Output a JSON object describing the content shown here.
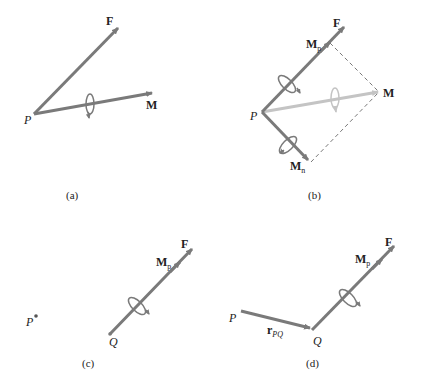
{
  "figure": {
    "panels": [
      {
        "id": "a",
        "caption": "(a)",
        "labels": {
          "force": "F",
          "moment": "M",
          "point": "P"
        }
      },
      {
        "id": "b",
        "caption": "(b)",
        "labels": {
          "force": "F",
          "moment": "M",
          "point": "P",
          "parallel_component": "M",
          "parallel_sub": "p",
          "normal_component": "M",
          "normal_sub": "n"
        }
      },
      {
        "id": "c",
        "caption": "(c)",
        "labels": {
          "force": "F",
          "parallel_component": "M",
          "parallel_sub": "p",
          "point_p": "P",
          "point_q": "Q"
        }
      },
      {
        "id": "d",
        "caption": "(d)",
        "labels": {
          "force": "F",
          "parallel_component": "M",
          "parallel_sub": "p",
          "point_p": "P",
          "point_q": "Q",
          "position_vector": "r",
          "position_sub": "PQ"
        }
      }
    ],
    "colors": {
      "vector": "#7a7a7a",
      "vector_light": "#c4c4c4",
      "dashed": "#555555",
      "text": "#222222"
    }
  }
}
